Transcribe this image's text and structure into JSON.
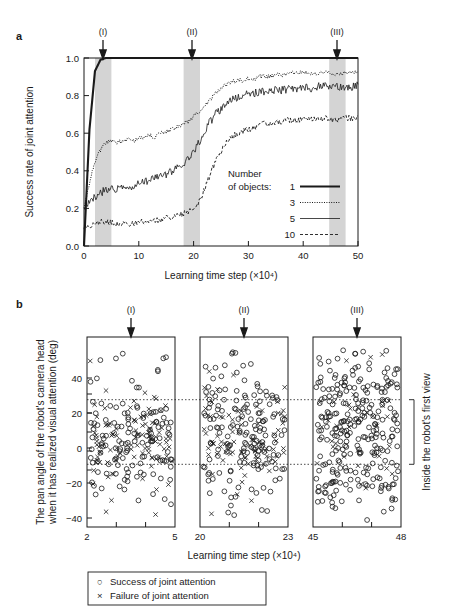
{
  "figure": {
    "panel_a_letter": "a",
    "panel_b_letter": "b"
  },
  "panel_a": {
    "ylabel": "Success rate of joint attention",
    "xlabel": "Learning time step (×10⁴)",
    "ytick_labels": [
      "1.0",
      "0.8",
      "0.6",
      "0.4",
      "0.2",
      "0.0"
    ],
    "xtick_labels": [
      "0",
      "10",
      "20",
      "30",
      "40",
      "50"
    ],
    "markers": [
      "(I)",
      "(II)",
      "(III)"
    ],
    "legend_title_line1": "Number",
    "legend_title_line2": "of objects:",
    "legend_items": [
      {
        "label": "1",
        "style": "solid-thick"
      },
      {
        "label": "3",
        "style": "dotted"
      },
      {
        "label": "5",
        "style": "solid-thin"
      },
      {
        "label": "10",
        "style": "dashed"
      }
    ]
  },
  "panel_b": {
    "ylabel_line1": "The pan angle of the robot's camera head",
    "ylabel_line2": "when it has realized visual attention (deg)",
    "xlabel": "Learning time step (×10⁴)",
    "ytick_labels": [
      "40",
      "20",
      "0",
      "−20",
      "−40"
    ],
    "markers": [
      "(I)",
      "(II)",
      "(III)"
    ],
    "subplots": [
      {
        "xmin_label": "2",
        "xmax_label": "5"
      },
      {
        "xmin_label": "20",
        "xmax_label": "23"
      },
      {
        "xmin_label": "45",
        "xmax_label": "48"
      }
    ],
    "bracket_label": "Inside the robot's first view",
    "legend_items": [
      {
        "symbol": "○",
        "label": "Success of joint attention"
      },
      {
        "symbol": "×",
        "label": "Failure of joint attention"
      }
    ]
  },
  "chart_data": [
    {
      "type": "line",
      "title": "",
      "xlabel": "Learning time step (×10⁴)",
      "ylabel": "Success rate of joint attention",
      "xlim": [
        0,
        50
      ],
      "ylim": [
        0.0,
        1.0
      ],
      "xticks": [
        0,
        10,
        20,
        30,
        40,
        50
      ],
      "yticks": [
        0.0,
        0.2,
        0.4,
        0.6,
        0.8,
        1.0
      ],
      "grid": false,
      "legend_position": "inside-right",
      "shaded_regions": [
        [
          2,
          5
        ],
        [
          20,
          23
        ],
        [
          45,
          48
        ]
      ],
      "annotations": [
        {
          "text": "(I)",
          "x": 3.5
        },
        {
          "text": "(II)",
          "x": 21.5
        },
        {
          "text": "(III)",
          "x": 46.5
        }
      ],
      "x": [
        0,
        1,
        2,
        3,
        4,
        5,
        6,
        7,
        8,
        9,
        10,
        11,
        12,
        13,
        14,
        15,
        16,
        17,
        18,
        19,
        20,
        21,
        22,
        23,
        24,
        25,
        26,
        27,
        28,
        29,
        30,
        31,
        32,
        33,
        34,
        35,
        36,
        37,
        38,
        39,
        40,
        41,
        42,
        43,
        44,
        45,
        46,
        47,
        48,
        49,
        50
      ],
      "series": [
        {
          "name": "1",
          "style": "solid-thick",
          "values": [
            0.0,
            0.62,
            0.93,
            0.99,
            1.0,
            1.0,
            1.0,
            1.0,
            1.0,
            1.0,
            1.0,
            1.0,
            1.0,
            1.0,
            1.0,
            1.0,
            1.0,
            1.0,
            1.0,
            1.0,
            1.0,
            1.0,
            1.0,
            1.0,
            1.0,
            1.0,
            1.0,
            1.0,
            1.0,
            1.0,
            1.0,
            1.0,
            1.0,
            1.0,
            1.0,
            1.0,
            1.0,
            1.0,
            1.0,
            1.0,
            1.0,
            1.0,
            1.0,
            1.0,
            1.0,
            1.0,
            1.0,
            1.0,
            1.0,
            1.0,
            1.0
          ]
        },
        {
          "name": "3",
          "style": "dotted",
          "values": [
            0.2,
            0.33,
            0.45,
            0.51,
            0.55,
            0.56,
            0.55,
            0.56,
            0.57,
            0.56,
            0.57,
            0.58,
            0.59,
            0.58,
            0.6,
            0.61,
            0.62,
            0.63,
            0.65,
            0.66,
            0.69,
            0.71,
            0.74,
            0.78,
            0.81,
            0.84,
            0.86,
            0.87,
            0.88,
            0.88,
            0.89,
            0.89,
            0.9,
            0.9,
            0.9,
            0.91,
            0.91,
            0.91,
            0.92,
            0.92,
            0.92,
            0.92,
            0.92,
            0.92,
            0.92,
            0.92,
            0.91,
            0.92,
            0.92,
            0.92,
            0.93
          ]
        },
        {
          "name": "5",
          "style": "solid-thin",
          "values": [
            0.2,
            0.23,
            0.26,
            0.28,
            0.3,
            0.31,
            0.3,
            0.31,
            0.32,
            0.32,
            0.33,
            0.34,
            0.35,
            0.36,
            0.37,
            0.38,
            0.4,
            0.42,
            0.44,
            0.46,
            0.5,
            0.55,
            0.61,
            0.66,
            0.7,
            0.73,
            0.76,
            0.78,
            0.79,
            0.8,
            0.81,
            0.81,
            0.82,
            0.82,
            0.83,
            0.83,
            0.83,
            0.83,
            0.84,
            0.84,
            0.84,
            0.84,
            0.84,
            0.85,
            0.85,
            0.85,
            0.85,
            0.85,
            0.84,
            0.85,
            0.86
          ]
        },
        {
          "name": "10",
          "style": "dashed",
          "values": [
            0.1,
            0.11,
            0.12,
            0.13,
            0.13,
            0.13,
            0.12,
            0.12,
            0.12,
            0.12,
            0.13,
            0.13,
            0.13,
            0.14,
            0.14,
            0.15,
            0.15,
            0.16,
            0.17,
            0.18,
            0.2,
            0.24,
            0.3,
            0.38,
            0.45,
            0.5,
            0.55,
            0.58,
            0.6,
            0.61,
            0.62,
            0.63,
            0.64,
            0.65,
            0.65,
            0.66,
            0.66,
            0.67,
            0.67,
            0.67,
            0.68,
            0.68,
            0.68,
            0.68,
            0.68,
            0.67,
            0.67,
            0.68,
            0.68,
            0.68,
            0.69
          ]
        }
      ]
    },
    {
      "type": "scatter",
      "title": "",
      "xlabel": "Learning time step (×10⁴)",
      "ylabel": "The pan angle of the robot's camera head when it has realized visual attention (deg)",
      "ylim": [
        -50,
        50
      ],
      "yticks": [
        -40,
        -20,
        0,
        20,
        40
      ],
      "grid": false,
      "reference_lines": [
        17,
        -17
      ],
      "subplot_xlims": [
        [
          2,
          5
        ],
        [
          20,
          23
        ],
        [
          45,
          48
        ]
      ],
      "legend_entries": [
        "Success of joint attention",
        "Failure of joint attention"
      ],
      "annotations": [
        {
          "text": "(I)",
          "subplot": 0
        },
        {
          "text": "(II)",
          "subplot": 1
        },
        {
          "text": "(III)",
          "subplot": 2
        }
      ],
      "note": "Point positions generated pseudo-randomly within the distribution described by each subplot; success (circle) fraction rises and spread widens across panels I→III."
    }
  ]
}
